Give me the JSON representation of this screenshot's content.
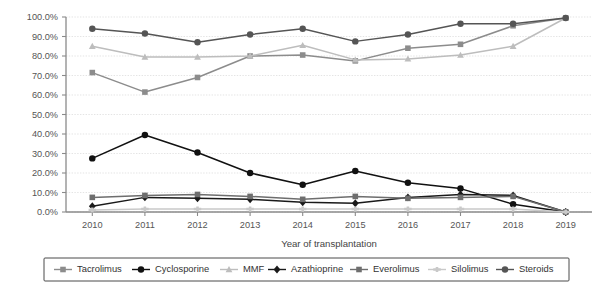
{
  "chart_data": {
    "type": "line",
    "title": "",
    "xlabel": "Year of transplantation",
    "ylabel": "",
    "x": [
      2010,
      2011,
      2012,
      2013,
      2014,
      2015,
      2016,
      2017,
      2018,
      2019
    ],
    "categories": [
      "2010",
      "2011",
      "2012",
      "2013",
      "2014",
      "2015",
      "2016",
      "2017",
      "2018",
      "2019"
    ],
    "ylim": [
      0,
      100
    ],
    "ytick_values": [
      0,
      10,
      20,
      30,
      40,
      50,
      60,
      70,
      80,
      90,
      100
    ],
    "ytick_labels": [
      "0.0%",
      "10.0%",
      "20.0%",
      "30.0%",
      "40.0%",
      "50.0%",
      "60.0%",
      "70.0%",
      "80.0%",
      "90.0%",
      "100.0%"
    ],
    "grid": true,
    "legend_position": "bottom",
    "series": [
      {
        "name": "Tacrolimus",
        "marker": "square",
        "color": "#8c8c8c",
        "values": [
          71.5,
          61.5,
          69.0,
          80.0,
          80.5,
          77.5,
          84.0,
          86.0,
          95.5,
          99.5
        ]
      },
      {
        "name": "Cyclosporine",
        "marker": "circle",
        "color": "#111111",
        "values": [
          27.5,
          39.5,
          30.5,
          20.0,
          14.0,
          21.0,
          15.0,
          12.0,
          4.0,
          0.0
        ]
      },
      {
        "name": "MMF",
        "marker": "triangle",
        "color": "#bdbdbd",
        "values": [
          85.0,
          79.5,
          79.5,
          80.0,
          85.5,
          78.0,
          78.5,
          80.5,
          85.0,
          99.5
        ]
      },
      {
        "name": "Azathioprine",
        "marker": "diamond",
        "color": "#1a1a1a",
        "values": [
          3.0,
          7.5,
          7.0,
          6.5,
          5.0,
          4.5,
          7.5,
          9.0,
          8.5,
          0.0
        ]
      },
      {
        "name": "Everolimus",
        "marker": "square",
        "color": "#6e6e6e",
        "values": [
          7.5,
          8.5,
          9.0,
          8.0,
          6.5,
          8.0,
          7.0,
          7.5,
          8.0,
          0.0
        ]
      },
      {
        "name": "Silolimus",
        "marker": "cross",
        "color": "#c9c9c9",
        "values": [
          1.0,
          1.5,
          1.5,
          1.5,
          1.5,
          1.5,
          1.5,
          1.5,
          1.5,
          0.0
        ]
      },
      {
        "name": "Steroids",
        "marker": "circle",
        "color": "#555555",
        "values": [
          94.0,
          91.5,
          87.0,
          91.0,
          94.0,
          87.5,
          91.0,
          96.5,
          96.5,
          99.5
        ]
      }
    ]
  },
  "legend": {
    "items": [
      {
        "label": "Tacrolimus"
      },
      {
        "label": "Cyclosporine"
      },
      {
        "label": "MMF"
      },
      {
        "label": "Azathioprine"
      },
      {
        "label": "Everolimus"
      },
      {
        "label": "Silolimus"
      },
      {
        "label": "Steroids"
      }
    ]
  },
  "axes": {
    "x_title": "Year of transplantation"
  }
}
